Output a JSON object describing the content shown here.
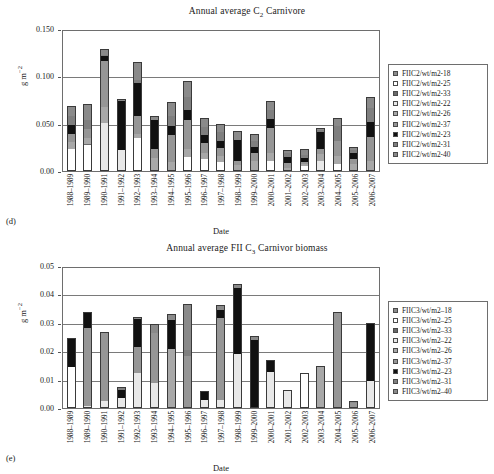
{
  "figure": {
    "panels": [
      {
        "panel_label": "(d)",
        "title_html": "Annual average C<sub>2</sub> Carnivore"
      },
      {
        "panel_label": "(e)",
        "title_html": "Annual average FII C<sub>3</sub> Carnivor biomass"
      }
    ]
  },
  "axis": {
    "ylabel_main": "g m",
    "ylabel_sup": "−2",
    "xlabel": "Date"
  },
  "series_colors": {
    "s18": "#8c8c8c",
    "s25": "#ffffff",
    "s33": "#6a6a6a",
    "s22": "#e8e8e8",
    "s26": "#a8a8a8",
    "s37": "#969696",
    "s23": "#111111",
    "s31": "#7f7f7f",
    "s40": "#8a8a8a"
  },
  "chart_data": [
    {
      "id": "panel-d",
      "type": "bar",
      "stacked": true,
      "title": "Annual average C2 Carnivore",
      "xlabel": "Date",
      "ylabel": "g m-2",
      "ylim": [
        0.0,
        0.15
      ],
      "yticks": [
        "0.00",
        "0.050",
        "0.100",
        "0.150"
      ],
      "ytick_values": [
        0.0,
        0.05,
        0.1,
        0.15
      ],
      "grid": true,
      "legend_position": "right",
      "categories": [
        "1988–1989",
        "1989–1990",
        "1990–1991",
        "1991–1992",
        "1992–1993",
        "1993–1994",
        "1994–1995",
        "1995–1996",
        "1996–1997",
        "1997–1998",
        "1998–1999",
        "1999–2000",
        "2000–2001",
        "2001–2002",
        "2002–2003",
        "2003–2004",
        "2004–2005",
        "2005–2006",
        "2006–2007"
      ],
      "series": [
        {
          "name": "FIIC2/wt/m2-18",
          "color_key": "s18",
          "values": [
            0.0,
            0.0,
            0.0,
            0.0,
            0.0,
            0.0,
            0.0,
            0.0,
            0.0,
            0.0,
            0.0,
            0.0,
            0.0,
            0.0,
            0.0,
            0.0,
            0.0,
            0.0,
            0.0
          ]
        },
        {
          "name": "FIIC2/wt/m2-25",
          "color_key": "s25",
          "values": [
            0.022,
            0.026,
            0.0,
            0.0,
            0.034,
            0.0,
            0.0,
            0.014,
            0.012,
            0.008,
            0.0,
            0.0,
            0.009,
            0.0,
            0.004,
            0.0,
            0.006,
            0.0,
            0.0
          ]
        },
        {
          "name": "FIIC2/wt/m2-33",
          "color_key": "s33",
          "values": [
            0.0,
            0.002,
            0.0,
            0.0,
            0.0,
            0.0,
            0.0,
            0.0,
            0.0,
            0.0,
            0.0,
            0.0,
            0.0,
            0.0,
            0.0,
            0.0,
            0.0,
            0.0,
            0.0
          ]
        },
        {
          "name": "FIIC2/wt/m2-22",
          "color_key": "s22",
          "values": [
            0.0,
            0.0,
            0.05,
            0.021,
            0.0,
            0.0,
            0.0,
            0.0,
            0.0,
            0.0,
            0.0,
            0.0,
            0.0,
            0.0,
            0.0,
            0.009,
            0.0,
            0.0,
            0.0
          ]
        },
        {
          "name": "FIIC2/wt/m2-26",
          "color_key": "s26",
          "values": [
            0.008,
            0.006,
            0.017,
            0.0,
            0.004,
            0.013,
            0.008,
            0.008,
            0.006,
            0.007,
            0.005,
            0.01,
            0.009,
            0.002,
            0.002,
            0.008,
            0.009,
            0.006,
            0.009
          ]
        },
        {
          "name": "FIIC2/wt/m2-37",
          "color_key": "s37",
          "values": [
            0.008,
            0.009,
            0.048,
            0.0,
            0.019,
            0.009,
            0.029,
            0.031,
            0.011,
            0.008,
            0.005,
            0.008,
            0.026,
            0.005,
            0.003,
            0.005,
            0.016,
            0.006,
            0.026
          ]
        },
        {
          "name": "FIIC2/wt/m2-23",
          "color_key": "s23",
          "values": [
            0.01,
            0.0,
            0.005,
            0.052,
            0.035,
            0.031,
            0.01,
            0.01,
            0.008,
            0.008,
            0.022,
            0.006,
            0.01,
            0.007,
            0.004,
            0.018,
            0.0,
            0.006,
            0.016
          ]
        },
        {
          "name": "FIIC2/wt/m2-31",
          "color_key": "s31",
          "values": [
            0.009,
            0.01,
            0.002,
            0.0,
            0.003,
            0.0,
            0.01,
            0.014,
            0.008,
            0.009,
            0.0,
            0.007,
            0.009,
            0.004,
            0.003,
            0.002,
            0.015,
            0.003,
            0.015
          ]
        },
        {
          "name": "FIIC2/wt/m2-40",
          "color_key": "s40",
          "values": [
            0.01,
            0.016,
            0.005,
            0.001,
            0.018,
            0.003,
            0.014,
            0.016,
            0.009,
            0.008,
            0.008,
            0.006,
            0.009,
            0.002,
            0.005,
            0.001,
            0.008,
            0.002,
            0.01
          ]
        }
      ]
    },
    {
      "id": "panel-e",
      "type": "bar",
      "stacked": true,
      "title": "Annual average FII C3 Carnivor biomass",
      "xlabel": "Date",
      "ylabel": "g m-2",
      "ylim": [
        0.0,
        0.05
      ],
      "yticks": [
        "0.00",
        "0.01",
        "0.02",
        "0.03",
        "0.04",
        "0.05"
      ],
      "ytick_values": [
        0.0,
        0.01,
        0.02,
        0.03,
        0.04,
        0.05
      ],
      "grid": true,
      "legend_position": "right",
      "categories": [
        "1988–1989",
        "1989–1990",
        "1990–1991",
        "1991–1992",
        "1992–1993",
        "1993–1994",
        "1994–1995",
        "1995–1996",
        "1996–1997",
        "1997–1998",
        "1998–1999",
        "1999–2000",
        "2000–2001",
        "2001–2002",
        "2002–2003",
        "2003–2004",
        "2004–2005",
        "2005–2006",
        "2006–2007"
      ],
      "series": [
        {
          "name": "FIIC3/wt/m2–18",
          "color_key": "s18",
          "values": [
            0.0,
            0.0,
            0.0,
            0.0,
            0.0,
            0.0,
            0.0,
            0.0,
            0.0,
            0.0,
            0.0,
            0.0,
            0.0,
            0.0,
            0.0,
            0.0,
            0.0,
            0.0,
            0.0
          ]
        },
        {
          "name": "FIIC3/wt/m2–25",
          "color_key": "s25",
          "values": [
            0.014,
            0.0,
            0.0,
            0.0,
            0.0,
            0.0,
            0.0,
            0.0,
            0.0,
            0.0,
            0.0,
            0.0,
            0.0,
            0.0,
            0.0118,
            0.0,
            0.0,
            0.0,
            0.0
          ]
        },
        {
          "name": "FIIC3/wt/m2–33",
          "color_key": "s33",
          "values": [
            0.0,
            0.0,
            0.0,
            0.0,
            0.0,
            0.0,
            0.0,
            0.0,
            0.0,
            0.0,
            0.0,
            0.0,
            0.0,
            0.0,
            0.0,
            0.0,
            0.0,
            0.0,
            0.0
          ]
        },
        {
          "name": "FIIC3/wt/m2–22",
          "color_key": "s22",
          "values": [
            0.0,
            0.0005,
            0.002,
            0.003,
            0.012,
            0.0085,
            0.0,
            0.0,
            0.0025,
            0.0025,
            0.0185,
            0.0,
            0.0125,
            0.0058,
            0.0,
            0.0,
            0.0,
            0.0,
            0.0093
          ]
        },
        {
          "name": "FIIC3/wt/m2–26",
          "color_key": "s26",
          "values": [
            0.0,
            0.0,
            0.0,
            0.0,
            0.0,
            0.0,
            0.0205,
            0.0,
            0.0,
            0.0,
            0.0,
            0.0,
            0.0,
            0.0,
            0.0,
            0.014,
            0.0,
            0.0,
            0.0
          ]
        },
        {
          "name": "FIIC3/wt/m2–37",
          "color_key": "s37",
          "values": [
            0.0,
            0.0275,
            0.024,
            0.0,
            0.009,
            0.0175,
            0.0,
            0.018,
            0.0,
            0.029,
            0.0,
            0.0,
            0.0,
            0.0,
            0.0,
            0.0,
            0.033,
            0.0015,
            0.0
          ]
        },
        {
          "name": "FIIC3/wt/m2–23",
          "color_key": "s23",
          "values": [
            0.01,
            0.005,
            0.0,
            0.003,
            0.01,
            0.0,
            0.01,
            0.0,
            0.0028,
            0.0025,
            0.0235,
            0.0235,
            0.0038,
            0.0,
            0.0,
            0.0,
            0.0,
            0.0,
            0.02
          ]
        },
        {
          "name": "FIIC3/wt/m2–31",
          "color_key": "s31",
          "values": [
            0.0,
            0.0,
            0.0,
            0.0008,
            0.0,
            0.0,
            0.0,
            0.002,
            0.0,
            0.0,
            0.0,
            0.0,
            0.0,
            0.0,
            0.0,
            0.0,
            0.0,
            0.0,
            0.0
          ]
        },
        {
          "name": "FIIC3/wt/m2–40",
          "color_key": "s40",
          "values": [
            0.0,
            0.0,
            0.0,
            0.0,
            0.0005,
            0.003,
            0.002,
            0.016,
            0.0,
            0.0015,
            0.0008,
            0.0012,
            0.0,
            0.0,
            0.0,
            0.0,
            0.0,
            0.0003,
            0.0
          ]
        }
      ]
    }
  ],
  "legends": [
    {
      "id": "legend-d",
      "items": [
        {
          "label": "FIIC2/wt/m2-18",
          "color_key": "s18"
        },
        {
          "label": "FIIC2/wt/m2-25",
          "color_key": "s25"
        },
        {
          "label": "FIIC2/wt/m2-33",
          "color_key": "s33"
        },
        {
          "label": "FIIC2/wt/m2-22",
          "color_key": "s22"
        },
        {
          "label": "FIIC2/wt/m2-26",
          "color_key": "s26"
        },
        {
          "label": "FIIC2/wt/m2-37",
          "color_key": "s37"
        },
        {
          "label": "FIIC2/wt/m2-23",
          "color_key": "s23"
        },
        {
          "label": "FIIC2/wt/m2-31",
          "color_key": "s31"
        },
        {
          "label": "FIIC2/wt/m2-40",
          "color_key": "s40"
        }
      ]
    },
    {
      "id": "legend-e",
      "items": [
        {
          "label": "FIIC3/wt/m2–18",
          "color_key": "s18"
        },
        {
          "label": "FIIC3/wt/m2–25",
          "color_key": "s25"
        },
        {
          "label": "FIIC3/wt/m2–33",
          "color_key": "s33"
        },
        {
          "label": "FIIC3/wt/m2–22",
          "color_key": "s22"
        },
        {
          "label": "FIIC3/wt/m2–26",
          "color_key": "s26"
        },
        {
          "label": "FIIC3/wt/m2–37",
          "color_key": "s37"
        },
        {
          "label": "FIIC3/wt/m2–23",
          "color_key": "s23"
        },
        {
          "label": "FIIC3/wt/m2–31",
          "color_key": "s31"
        },
        {
          "label": "FIIC3/wt/m2–40",
          "color_key": "s40"
        }
      ]
    }
  ]
}
